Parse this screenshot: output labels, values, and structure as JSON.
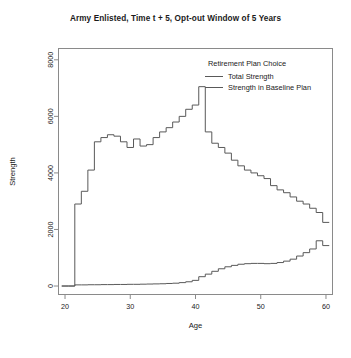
{
  "chart_data": {
    "type": "line",
    "title": "Army Enlisted, Time t + 5, Opt-out Window of 5 Years",
    "xlabel": "Age",
    "ylabel": "Strength",
    "xlim": [
      19,
      61
    ],
    "ylim": [
      -300,
      8400
    ],
    "xticks": [
      20,
      30,
      40,
      50,
      60
    ],
    "yticks": [
      0,
      2000,
      4000,
      6000,
      8000
    ],
    "xtick_labels": [
      "20",
      "30",
      "40",
      "50",
      "60"
    ],
    "ytick_labels": [
      "0",
      "2000",
      "4000",
      "6000",
      "8000"
    ],
    "grid": false,
    "line_style": "step",
    "legend": {
      "title": "Retirement Plan Choice",
      "position": "top-right-inside",
      "entries": [
        "Total Strength",
        "Strength in Baseline Plan"
      ]
    },
    "x": [
      20,
      21,
      22,
      23,
      24,
      25,
      26,
      27,
      28,
      29,
      30,
      31,
      32,
      33,
      34,
      35,
      36,
      37,
      38,
      39,
      40,
      41,
      42,
      43,
      44,
      45,
      46,
      47,
      48,
      49,
      50,
      51,
      52,
      53,
      54,
      55,
      56,
      57,
      58,
      59,
      60
    ],
    "series": [
      {
        "name": "Total Strength",
        "color": "#595959",
        "values": [
          0,
          0,
          2900,
          3350,
          4100,
          5100,
          5250,
          5350,
          5300,
          5100,
          4900,
          5200,
          4950,
          5000,
          5250,
          5450,
          5600,
          5800,
          6000,
          6250,
          6400,
          7050,
          5450,
          5050,
          4900,
          4700,
          4450,
          4250,
          4100,
          4000,
          3900,
          3800,
          3550,
          3400,
          3300,
          3150,
          3000,
          2900,
          2750,
          2600,
          2250
        ]
      },
      {
        "name": "Strength in Baseline Plan",
        "color": "#595959",
        "values": [
          0,
          0,
          40,
          40,
          45,
          45,
          50,
          50,
          55,
          55,
          60,
          60,
          65,
          70,
          75,
          80,
          90,
          100,
          120,
          150,
          200,
          330,
          420,
          520,
          610,
          680,
          730,
          770,
          790,
          800,
          800,
          790,
          800,
          830,
          880,
          950,
          1060,
          1180,
          1310,
          1600,
          1430
        ]
      }
    ],
    "annotations": {
      "peak_age": 41,
      "peak_value": 7050
    }
  }
}
